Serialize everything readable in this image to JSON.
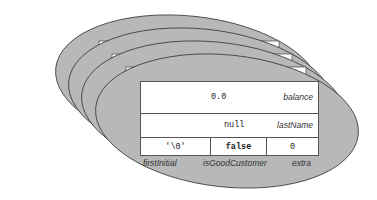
{
  "diagram": {
    "type": "stacked-object-instances",
    "instance_count": 4,
    "colors": {
      "ellipse_fill": "#b8b8b8",
      "ellipse_stroke": "#333333",
      "table_fill": "#ffffff",
      "table_stroke": "#555555"
    },
    "fields": {
      "balance": {
        "value": "0.0",
        "name": "balance"
      },
      "lastName": {
        "value": "null",
        "name": "lastName"
      },
      "firstInitial": {
        "value": "'\\0'",
        "name": "firstInitial"
      },
      "isGoodCustomer": {
        "value": "false",
        "name": "isGoodCustomer"
      },
      "extra": {
        "value": "0",
        "name": "extra"
      }
    }
  }
}
